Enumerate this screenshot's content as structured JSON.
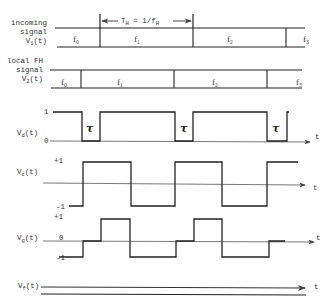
{
  "diagram": {
    "period_label": "T_H = 1/f_H",
    "period_text": {
      "T": "T",
      "Tsub": "H",
      "eq": " = 1/f",
      "fsub": "H"
    },
    "incoming": {
      "label_lines": [
        "incoming",
        "signal"
      ],
      "var": "V",
      "var_sub": "1",
      "var_suffix": "(t)",
      "segments": [
        {
          "name": "f",
          "sub": "0"
        },
        {
          "name": "f",
          "sub": "1"
        },
        {
          "name": "f",
          "sub": "2"
        },
        {
          "name": "f",
          "sub": "3"
        }
      ]
    },
    "local": {
      "label_lines": [
        "local FH",
        "signal"
      ],
      "var": "V",
      "var_sub": "2",
      "var_suffix": "(t)",
      "segments": [
        {
          "name": "f",
          "sub": "0"
        },
        {
          "name": "f",
          "sub": "1"
        },
        {
          "name": "f",
          "sub": "2"
        },
        {
          "name": "f",
          "sub": "3"
        }
      ]
    },
    "vd": {
      "var": "V",
      "var_sub": "d",
      "var_suffix": "(t)",
      "high": "1",
      "low": "0",
      "tau": "τ",
      "axis": "t"
    },
    "vc": {
      "var": "V",
      "var_sub": "c",
      "var_suffix": "(t)",
      "high": "+1",
      "low": "-1",
      "axis": "t"
    },
    "vg": {
      "var": "V",
      "var_sub": "g",
      "var_suffix": "(t)",
      "high": "+1",
      "zero": "0",
      "low": "-1",
      "axis": "t"
    },
    "vf": {
      "var": "V",
      "var_sub": "f",
      "var_suffix": "(t)",
      "axis": "t"
    }
  }
}
